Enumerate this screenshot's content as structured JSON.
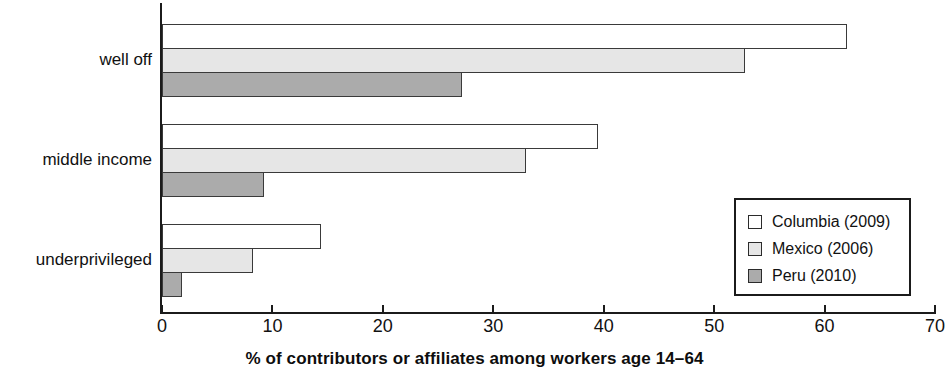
{
  "chart_data": {
    "type": "bar",
    "orientation": "horizontal",
    "title": "",
    "xlabel": "% of contributors or affiliates among workers age 14–64",
    "ylabel": "",
    "xlim": [
      0,
      70
    ],
    "xticks": [
      0,
      10,
      20,
      30,
      40,
      50,
      60,
      70
    ],
    "xtick_labels": [
      "0",
      "10",
      "20",
      "30",
      "40",
      "50",
      "60",
      "70"
    ],
    "grid": false,
    "legend_position": "inside-right",
    "categories": [
      "well off",
      "middle income",
      "underprivileged"
    ],
    "series": [
      {
        "name": "Columbia (2009)",
        "color": "#ffffff",
        "values": [
          62.0,
          39.5,
          14.4
        ]
      },
      {
        "name": "Mexico (2006)",
        "color": "#e6e6e6",
        "values": [
          52.8,
          33.0,
          8.2
        ]
      },
      {
        "name": "Peru (2010)",
        "color": "#ababab",
        "values": [
          27.2,
          9.2,
          1.8
        ]
      }
    ]
  },
  "legend": {
    "entries": [
      {
        "label": "Columbia (2009)",
        "swatch": "white-square-icon"
      },
      {
        "label": "Mexico (2006)",
        "swatch": "light-gray-square-icon"
      },
      {
        "label": "Peru (2010)",
        "swatch": "gray-square-icon"
      }
    ]
  },
  "axis": {
    "x_title": "% of contributors or affiliates among workers age 14–64",
    "tick_labels": [
      "0",
      "10",
      "20",
      "30",
      "40",
      "50",
      "60",
      "70"
    ]
  },
  "categories": {
    "labels": [
      "well off",
      "middle income",
      "underprivileged"
    ]
  },
  "colors": {
    "series_columbia": "#ffffff",
    "series_mexico": "#e6e6e6",
    "series_peru": "#ababab",
    "axis": "#1b1b1b",
    "text": "#111111"
  }
}
